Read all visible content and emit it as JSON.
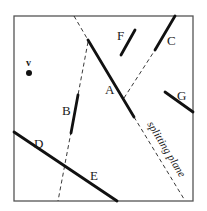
{
  "diagram": {
    "viewpoint": {
      "label": "v"
    },
    "segments": [
      {
        "id": "A",
        "label": "A"
      },
      {
        "id": "B",
        "label": "B"
      },
      {
        "id": "C",
        "label": "C"
      },
      {
        "id": "D",
        "label": "D"
      },
      {
        "id": "E",
        "label": "E"
      },
      {
        "id": "F",
        "label": "F"
      },
      {
        "id": "G",
        "label": "G"
      }
    ],
    "splitting_plane_label": "splitting plane",
    "colors": {
      "line": "#111111",
      "frame": "#555555",
      "background": "#ffffff"
    }
  }
}
